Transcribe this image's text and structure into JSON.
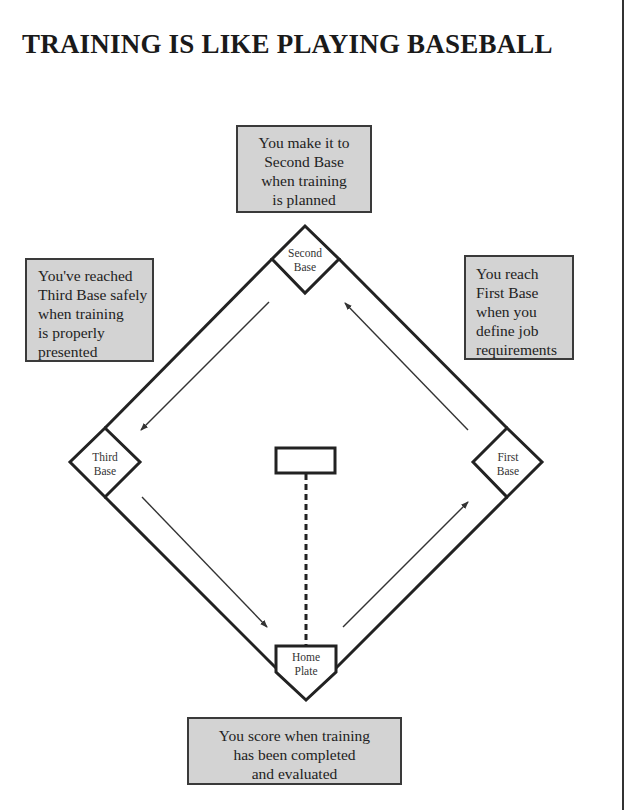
{
  "title": "TRAINING IS LIKE PLAYING BASEBALL",
  "callouts": {
    "second_base": {
      "lines": [
        "You make it to",
        "Second Base",
        "when training",
        "is planned"
      ]
    },
    "third_base": {
      "lines": [
        "You've reached",
        "Third Base safely",
        "when training",
        "is properly",
        "presented"
      ]
    },
    "first_base": {
      "lines": [
        "You reach",
        "First Base",
        "when you",
        "define job",
        "requirements"
      ]
    },
    "home": {
      "lines": [
        "You score when training",
        "has been completed",
        "and evaluated"
      ]
    }
  },
  "bases": {
    "second": {
      "line1": "Second",
      "line2": "Base"
    },
    "third": {
      "line1": "Third",
      "line2": "Base"
    },
    "first": {
      "line1": "First",
      "line2": "Base"
    },
    "home": {
      "line1": "Home",
      "line2": "Plate"
    }
  },
  "colors": {
    "callout_fill": "#d3d3d3",
    "line": "#222222"
  }
}
